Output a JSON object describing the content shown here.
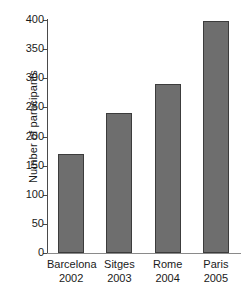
{
  "chart_data": {
    "type": "bar",
    "title": "",
    "subtitle": "",
    "xlabel": "",
    "ylabel": "Number of participants",
    "categories": [
      "Barcelona",
      "Sitges",
      "Rome",
      "Paris"
    ],
    "category_years": [
      "2002",
      "2003",
      "2004",
      "2005"
    ],
    "values": [
      170,
      240,
      290,
      398
    ],
    "ylim": [
      0,
      400
    ],
    "yticks": [
      0,
      50,
      100,
      150,
      200,
      250,
      300,
      350,
      400
    ],
    "ytick_labels": [
      "0",
      "50",
      "100",
      "150",
      "200",
      "250",
      "300",
      "350",
      "400"
    ],
    "grid": false,
    "legend": false,
    "legend_position": "none",
    "bar_color": "#6e6e6e",
    "bar_edge_color": "#3c3c3c",
    "axis_color": "#4a4a4a",
    "background": "#ffffff"
  }
}
